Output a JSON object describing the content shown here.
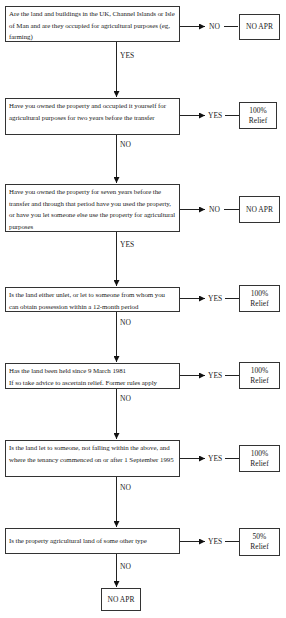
{
  "diagram": {
    "title": "",
    "questions": [
      {
        "id": "q1",
        "text": "Are the land and buildings in the UK, Channel Islands or Isle of Man and are they occupied for agricultural purposes (eg, farming)",
        "side_branch": "NO",
        "side_result": "NO APR",
        "down_branch": "YES"
      },
      {
        "id": "q2",
        "text": "Have you owned the property and occupied it yourself for agricultural purposes for two years before the transfer",
        "side_branch": "YES",
        "side_result": "100% Relief",
        "down_branch": "NO"
      },
      {
        "id": "q3",
        "text": "Have you owned the property for seven years before the transfer and through that period have you used the property, or have you let someone else use the property for agricultural purposes",
        "side_branch": "NO",
        "side_result": "NO APR",
        "down_branch": "YES"
      },
      {
        "id": "q4",
        "text": "Is the land either unlet, or let to someone from whom you can obtain possession within a 12-month period",
        "side_branch": "YES",
        "side_result": "100% Relief",
        "down_branch": "NO"
      },
      {
        "id": "q5",
        "text_line1": "Has the land been held since 9 March 1981",
        "text_line2": "If so take advice to ascertain relief. Former rules apply",
        "side_branch": "YES",
        "side_result": "100% Relief",
        "down_branch": "NO"
      },
      {
        "id": "q6",
        "text": "Is the land let to someone, not falling within the above, and where the tenancy commenced on or after 1 September 1995",
        "side_branch": "YES",
        "side_result": "100% Relief",
        "down_branch": "NO"
      },
      {
        "id": "q7",
        "text": "Is the property agricultural land of some other type",
        "side_branch": "YES",
        "side_result": "50% Relief",
        "down_branch": "NO"
      }
    ],
    "final_result": "NO APR"
  }
}
